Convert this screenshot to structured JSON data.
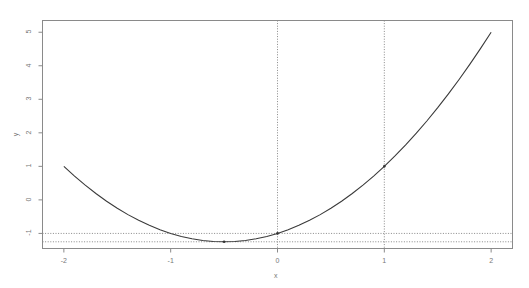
{
  "chart_data": {
    "type": "line",
    "title": "",
    "subtitle": "",
    "xlabel": "x",
    "ylabel": "y",
    "xlim": [
      -2.2,
      2.2
    ],
    "ylim": [
      -1.45,
      5.35
    ],
    "xticks": [
      -2,
      -1,
      0,
      1,
      2
    ],
    "xtick_labels": [
      "-2",
      "-1",
      "0",
      "1",
      "2"
    ],
    "yticks": [
      -1,
      0,
      1,
      2,
      3,
      4,
      5
    ],
    "ytick_labels": [
      "-1",
      "0",
      "1",
      "2",
      "3",
      "4",
      "5"
    ],
    "grid": false,
    "legend": null,
    "series": [
      {
        "name": "y = x^2 + x - 1",
        "type": "line",
        "color": "#3a3a3a",
        "x": [
          -2,
          -1.9,
          -1.8,
          -1.7,
          -1.6,
          -1.5,
          -1.4,
          -1.3,
          -1.2,
          -1.1,
          -1,
          -0.9,
          -0.8,
          -0.7,
          -0.6,
          -0.5,
          -0.4,
          -0.3,
          -0.2,
          -0.1,
          0,
          0.1,
          0.2,
          0.3,
          0.4,
          0.5,
          0.6,
          0.7,
          0.8,
          0.9,
          1,
          1.1,
          1.2,
          1.3,
          1.4,
          1.5,
          1.6,
          1.7,
          1.8,
          1.9,
          2
        ],
        "y": [
          1,
          0.71,
          0.44,
          0.19,
          -0.04,
          -0.25,
          -0.44,
          -0.61,
          -0.76,
          -0.89,
          -1,
          -1.09,
          -1.16,
          -1.21,
          -1.24,
          -1.25,
          -1.24,
          -1.21,
          -1.16,
          -1.09,
          -1,
          -0.89,
          -0.76,
          -0.61,
          -0.44,
          -0.25,
          -0.04,
          0.19,
          0.44,
          0.71,
          1,
          1.31,
          1.64,
          1.99,
          2.36,
          2.75,
          3.16,
          3.59,
          4.04,
          4.51,
          5
        ]
      }
    ],
    "points": [
      {
        "name": "vertex",
        "x": -0.5,
        "y": -1.25,
        "marker": "dot",
        "color": "#333333"
      },
      {
        "name": "y-intercept",
        "x": 0,
        "y": -1,
        "marker": "dot",
        "color": "#333333"
      },
      {
        "name": "x-one-value",
        "x": 1,
        "y": 1,
        "marker": "dot",
        "color": "#333333"
      }
    ],
    "reference_lines": [
      {
        "name": "vline-x-zero",
        "orientation": "vertical",
        "value": 0,
        "style": "dotted",
        "color": "#888888"
      },
      {
        "name": "vline-x-one",
        "orientation": "vertical",
        "value": 1,
        "style": "dotted",
        "color": "#888888"
      },
      {
        "name": "hline-y-minus-one",
        "orientation": "horizontal",
        "value": -1,
        "style": "dotted",
        "color": "#888888"
      },
      {
        "name": "hline-y-minimum",
        "orientation": "horizontal",
        "value": -1.25,
        "style": "dotted",
        "color": "#888888"
      }
    ],
    "box_color": "#8a8a8a",
    "background": "#ffffff"
  },
  "axes": {
    "x_title": "x",
    "y_title": "y"
  }
}
